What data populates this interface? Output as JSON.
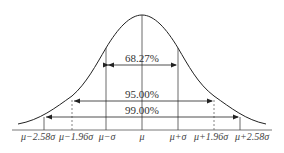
{
  "diagram": {
    "type": "normal-distribution",
    "colors": {
      "line": "#222222",
      "axis": "#555555"
    },
    "intervals": [
      {
        "label": "68.27%",
        "from": "μ−σ",
        "to": "μ+σ"
      },
      {
        "label": "95.00%",
        "from": "μ−1.96σ",
        "to": "μ+1.96σ"
      },
      {
        "label": "99.00%",
        "from": "μ−2.58σ",
        "to": "μ+2.58σ"
      }
    ],
    "ticks": [
      "μ−2.58σ",
      "μ−1.96σ",
      "μ−σ",
      "μ",
      "μ+σ",
      "μ+1.96σ",
      "μ+2.58σ"
    ]
  }
}
